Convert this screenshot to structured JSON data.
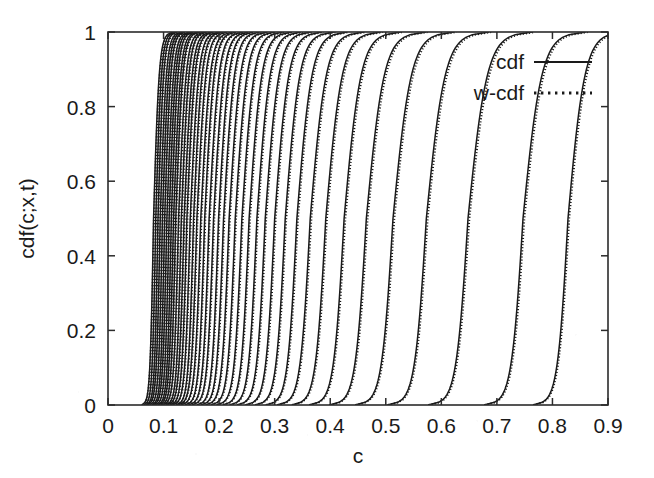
{
  "chart_data": {
    "type": "line",
    "title": "",
    "xlabel": "c",
    "ylabel": "cdf(c;x,t)",
    "xlim": [
      0,
      0.9
    ],
    "ylim": [
      0,
      1
    ],
    "xticks": [
      "0",
      "0.1",
      "0.2",
      "0.3",
      "0.4",
      "0.5",
      "0.6",
      "0.7",
      "0.8",
      "0.9"
    ],
    "xtick_values": [
      0,
      0.1,
      0.2,
      0.3,
      0.4,
      0.5,
      0.6,
      0.7,
      0.8,
      0.9
    ],
    "yticks": [
      "0",
      "0.2",
      "0.4",
      "0.6",
      "0.8",
      "1"
    ],
    "ytick_values": [
      0,
      0.2,
      0.4,
      0.6,
      0.8,
      1
    ],
    "grid": false,
    "legend_position": "top-right",
    "legend": [
      {
        "name": "cdf",
        "style": "solid"
      },
      {
        "name": "w-cdf",
        "style": "dotted"
      }
    ],
    "series_description": "Family of sigmoidal cumulative distribution curves, one pair (solid cdf and dotted w-cdf overlay) per time/position; curves are densely packed at low c and progressively more separated toward higher c.",
    "curve_midpoints": [
      0.082,
      0.086,
      0.09,
      0.094,
      0.098,
      0.102,
      0.106,
      0.11,
      0.114,
      0.118,
      0.122,
      0.127,
      0.132,
      0.137,
      0.142,
      0.148,
      0.154,
      0.16,
      0.167,
      0.174,
      0.182,
      0.19,
      0.199,
      0.208,
      0.218,
      0.229,
      0.241,
      0.254,
      0.268,
      0.283,
      0.3,
      0.319,
      0.34,
      0.364,
      0.392,
      0.425,
      0.465,
      0.513,
      0.573,
      0.648,
      0.747,
      0.828
    ],
    "curve_widths": [
      0.012,
      0.012,
      0.012,
      0.013,
      0.013,
      0.013,
      0.014,
      0.014,
      0.014,
      0.015,
      0.015,
      0.016,
      0.016,
      0.017,
      0.017,
      0.018,
      0.018,
      0.019,
      0.02,
      0.02,
      0.021,
      0.022,
      0.022,
      0.023,
      0.024,
      0.025,
      0.026,
      0.027,
      0.028,
      0.029,
      0.03,
      0.031,
      0.032,
      0.034,
      0.035,
      0.036,
      0.038,
      0.039,
      0.04,
      0.041,
      0.04,
      0.036
    ],
    "colors": {
      "line": "#1a1a1a",
      "axis": "#2b2b2b",
      "background": "#ffffff",
      "text": "#1a1a1a"
    }
  },
  "axes": {
    "x_axis_label": "c",
    "y_axis_label": "cdf(c;x,t)"
  }
}
